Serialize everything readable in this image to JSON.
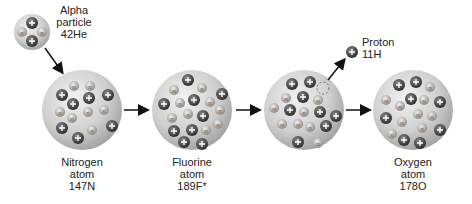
{
  "diagram": {
    "title": "",
    "colors": {
      "sphere": "#c8c8c8",
      "proton": "#4a4a4a",
      "neutron": "#a8a8a8",
      "arrow": "#111111"
    },
    "alpha": {
      "label_line1": "Alpha",
      "label_line2": "particle",
      "mass": "4",
      "atomic": "2",
      "symbol": "He"
    },
    "stages": [
      {
        "name_line1": "Nitrogen",
        "name_line2": "atom",
        "mass": "14",
        "atomic": "7",
        "symbol": "N"
      },
      {
        "name_line1": "Fluorine",
        "name_line2": "atom",
        "mass": "18",
        "atomic": "9",
        "symbol": "F*"
      },
      {
        "name_line1": "",
        "name_line2": "",
        "mass": "",
        "atomic": "",
        "symbol": ""
      },
      {
        "name_line1": "Oxygen",
        "name_line2": "atom",
        "mass": "17",
        "atomic": "8",
        "symbol": "O"
      }
    ],
    "proton": {
      "label": "Proton",
      "mass": "1",
      "atomic": "1",
      "symbol": "H"
    },
    "particle_symbols": {
      "proton": "+",
      "neutron": "n"
    }
  }
}
